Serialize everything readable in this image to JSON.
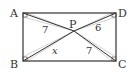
{
  "diagram": {
    "type": "geometry",
    "shape": "rectangle",
    "vertices": {
      "A": {
        "label": "A"
      },
      "B": {
        "label": "B"
      },
      "C": {
        "label": "C"
      },
      "D": {
        "label": "D"
      }
    },
    "interior_point": {
      "label": "P"
    },
    "segments": [
      {
        "from": "A",
        "to": "P",
        "label": "7"
      },
      {
        "from": "D",
        "to": "P",
        "label": "6"
      },
      {
        "from": "B",
        "to": "P",
        "label": "x"
      },
      {
        "from": "C",
        "to": "P",
        "label": "7"
      }
    ],
    "right_angle_marks": [
      "A",
      "B",
      "C",
      "D"
    ],
    "colors": {
      "stroke": "#333333",
      "helper": "#bbbbbb"
    }
  }
}
